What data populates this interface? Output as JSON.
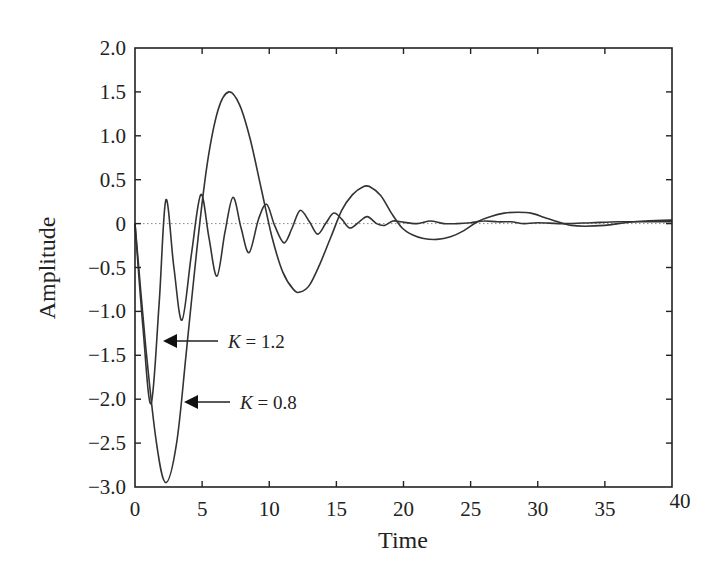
{
  "chart_data": {
    "type": "line",
    "title": "",
    "xlabel": "Time",
    "ylabel": "Amplitude",
    "xlim": [
      0,
      40
    ],
    "ylim": [
      -3.0,
      2.0
    ],
    "xticks": [
      "0",
      "5",
      "10",
      "15",
      "20",
      "25",
      "30",
      "35",
      "40"
    ],
    "yticks": [
      "2.0",
      "1.5",
      "1.0",
      "0.5",
      "0",
      "-0.5",
      "-1.0",
      "-1.5",
      "-2.0",
      "-2.5",
      "-3.0"
    ],
    "grid": false,
    "zero_line": "dotted",
    "legend": null,
    "annotations": [
      {
        "text_k": "K",
        "text_rest": " = 1.2",
        "arrow_to": [
          1.2,
          -1.3
        ]
      },
      {
        "text_k": "K",
        "text_rest": " = 0.8",
        "arrow_to": [
          3.2,
          -2.0
        ]
      }
    ],
    "series": [
      {
        "name": "K = 1.2",
        "x": [
          0,
          0.6,
          1.2,
          1.8,
          2.3,
          2.9,
          3.5,
          4.2,
          4.9,
          5.5,
          6.1,
          6.7,
          7.3,
          7.9,
          8.5,
          9.2,
          9.8,
          10.4,
          11.1,
          11.7,
          12.3,
          13.0,
          13.6,
          14.2,
          14.8,
          15.4,
          16.0,
          16.7,
          17.3,
          18.0,
          18.6,
          19.2,
          19.8,
          21,
          22,
          23,
          24,
          25,
          26,
          27,
          28,
          29,
          30,
          32,
          34,
          36,
          38,
          40
        ],
        "y": [
          0,
          -1.2,
          -2.05,
          -0.9,
          0.27,
          -0.5,
          -1.1,
          -0.35,
          0.33,
          -0.15,
          -0.6,
          -0.1,
          0.3,
          -0.05,
          -0.33,
          0.05,
          0.22,
          -0.02,
          -0.22,
          -0.05,
          0.15,
          0.02,
          -0.12,
          0.0,
          0.12,
          0.05,
          -0.05,
          0.02,
          0.08,
          0.0,
          -0.02,
          0.03,
          0.02,
          0.0,
          0.03,
          0.0,
          0.0,
          0.01,
          0.03,
          0.02,
          0.02,
          0.0,
          0.01,
          0.0,
          0.01,
          0.02,
          0.02,
          0.02
        ]
      },
      {
        "name": "K = 0.8",
        "x": [
          0,
          0.8,
          1.6,
          2.3,
          3.1,
          3.8,
          4.6,
          5.4,
          6.2,
          7.0,
          7.8,
          8.6,
          9.4,
          10.2,
          11.0,
          11.8,
          12.3,
          13.0,
          13.8,
          14.6,
          15.4,
          16.2,
          17.0,
          17.5,
          18.3,
          19.1,
          19.9,
          20.7,
          21.5,
          22.5,
          23.5,
          24.5,
          25.5,
          26.5,
          27.5,
          28.5,
          29.5,
          30.5,
          31.5,
          32.5,
          33.5,
          35,
          36.5,
          38,
          40
        ],
        "y": [
          0,
          -1.4,
          -2.5,
          -2.95,
          -2.5,
          -1.5,
          -0.3,
          0.7,
          1.3,
          1.5,
          1.35,
          0.95,
          0.4,
          -0.15,
          -0.55,
          -0.75,
          -0.78,
          -0.7,
          -0.45,
          -0.15,
          0.15,
          0.33,
          0.42,
          0.42,
          0.32,
          0.12,
          -0.05,
          -0.13,
          -0.17,
          -0.18,
          -0.15,
          -0.08,
          0.02,
          0.08,
          0.12,
          0.13,
          0.12,
          0.07,
          0.02,
          -0.02,
          -0.03,
          -0.02,
          0.01,
          0.03,
          0.04
        ]
      }
    ]
  }
}
